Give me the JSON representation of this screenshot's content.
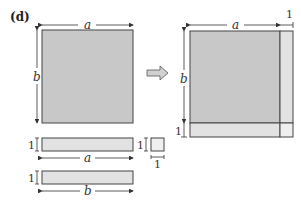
{
  "figure": {
    "panel_label": "(d)",
    "left_square": {
      "width_label": "a",
      "height_label": "b"
    },
    "strips": [
      {
        "thickness_label": "1",
        "length_label": "a"
      },
      {
        "thickness_label": "1",
        "length_label": "b"
      }
    ],
    "unit_square": {
      "height_label": "1",
      "width_label": "1"
    },
    "right_composite": {
      "width_label": "a",
      "height_label": "b",
      "extra_width_label": "1",
      "extra_height_label": "1"
    },
    "colors": {
      "main_fill": "#c8c8c8",
      "strip_fill": "#e2e2e2",
      "outline": "#444444"
    }
  }
}
